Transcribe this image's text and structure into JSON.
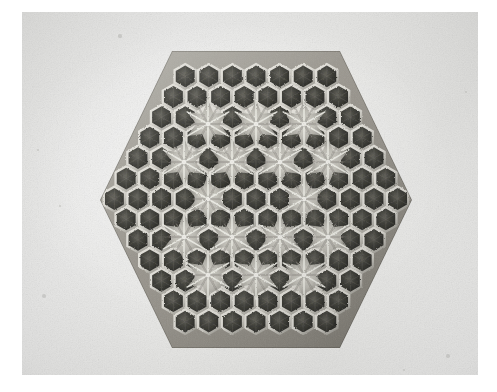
{
  "image": {
    "kind": "photograph",
    "medium": "black-and-white photographic print",
    "subject": "hexagonal honeycomb panel",
    "orientation": "landscape",
    "caption_text": "",
    "visible_text": []
  },
  "photo": {
    "frame": {
      "x": 22,
      "y": 12,
      "width": 456,
      "height": 363
    },
    "paper_color": "#e9e9e7",
    "paper_highlight": "#f2f2f1",
    "paper_shadow": "#dedede",
    "page_color": "#ffffff",
    "grain_opacity": 0.5
  },
  "subject": {
    "name": "honeycomb-hexagon-panel",
    "outline_shape": "hexagon",
    "outline_orientation": "flat-top",
    "center": {
      "x": 256,
      "y": 199
    },
    "circumradius_px": 156,
    "vertices": [
      {
        "x": 172,
        "y": 51
      },
      {
        "x": 340,
        "y": 51
      },
      {
        "x": 412,
        "y": 200
      },
      {
        "x": 340,
        "y": 348
      },
      {
        "x": 172,
        "y": 348
      },
      {
        "x": 100,
        "y": 200
      }
    ],
    "cell_shape": "hexagon",
    "cell_pitch_px": 23.6,
    "cells_per_edge": 8,
    "cell_dark_color": "#34342f",
    "cell_deep_color": "#1f1f1c",
    "wall_light_color": "#d8d6cf",
    "wall_mid_color": "#8e8c85",
    "rosette_color": "#b8b6ae",
    "rosette_count": 13,
    "rosettes": [
      {
        "x": 208,
        "y": 124
      },
      {
        "x": 256,
        "y": 124
      },
      {
        "x": 304,
        "y": 124
      },
      {
        "x": 184,
        "y": 162
      },
      {
        "x": 232,
        "y": 162
      },
      {
        "x": 280,
        "y": 162
      },
      {
        "x": 328,
        "y": 162
      },
      {
        "x": 208,
        "y": 199
      },
      {
        "x": 304,
        "y": 199
      },
      {
        "x": 184,
        "y": 237
      },
      {
        "x": 232,
        "y": 237
      },
      {
        "x": 280,
        "y": 237
      },
      {
        "x": 328,
        "y": 237
      },
      {
        "x": 208,
        "y": 275
      },
      {
        "x": 256,
        "y": 275
      },
      {
        "x": 304,
        "y": 275
      }
    ]
  },
  "specks": [
    {
      "x": 120,
      "y": 36,
      "r": 1.6
    },
    {
      "x": 60,
      "y": 206,
      "r": 1.3
    },
    {
      "x": 44,
      "y": 296,
      "r": 2.0
    },
    {
      "x": 448,
      "y": 356,
      "r": 1.8
    },
    {
      "x": 404,
      "y": 370,
      "r": 1.2
    },
    {
      "x": 38,
      "y": 150,
      "r": 1.0
    },
    {
      "x": 466,
      "y": 92,
      "r": 1.1
    }
  ]
}
